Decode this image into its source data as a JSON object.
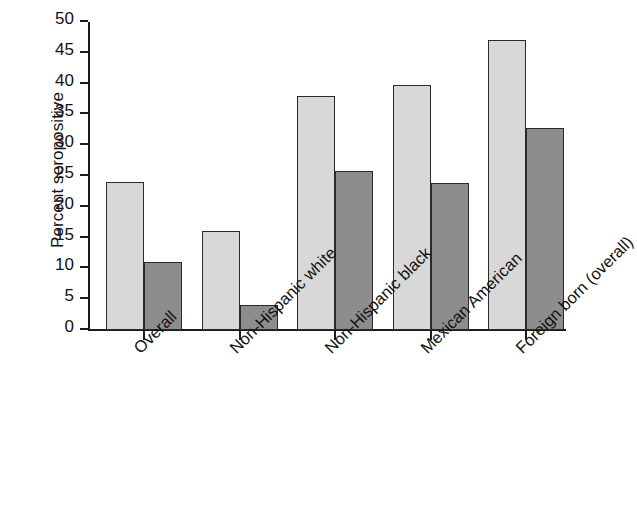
{
  "chart_data": {
    "type": "bar",
    "title": "",
    "xlabel": "",
    "ylabel": "Percent seropositive",
    "ylim": [
      0,
      50
    ],
    "ytick_labels": [
      "0",
      "5",
      "10",
      "15",
      "20",
      "25",
      "30",
      "35",
      "40",
      "45",
      "50"
    ],
    "ytick_values": [
      0,
      5,
      10,
      15,
      20,
      25,
      30,
      35,
      40,
      45,
      50
    ],
    "grid": false,
    "legend": "none",
    "categories": [
      "Overall",
      "Non-Hispanic white",
      "Non-Hispanic black",
      "Mexican American",
      "Foreign born (overall)"
    ],
    "series": [
      {
        "name": "series-1",
        "color": "#d8d8d8",
        "values": [
          24.0,
          16.0,
          38.0,
          39.8,
          47.0
        ]
      },
      {
        "name": "series-2",
        "color": "#8d8d8d",
        "values": [
          11.1,
          4.0,
          25.8,
          23.8,
          32.8
        ]
      }
    ],
    "bar_edge_color": "#2a2a2a",
    "axis_color": "#1c1c1c",
    "background_color": "#ffffff"
  }
}
